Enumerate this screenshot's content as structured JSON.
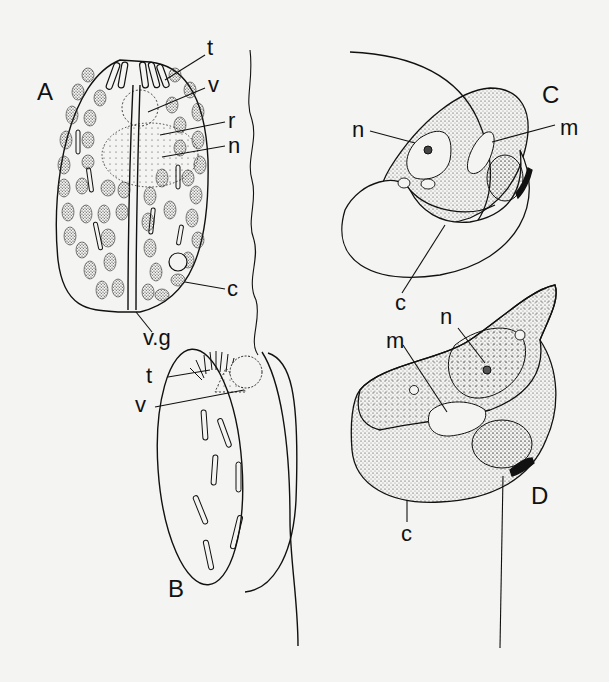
{
  "figure": {
    "background": "#f4f4f2",
    "ink": "#111111",
    "panels": [
      {
        "id": "A",
        "label": "A",
        "parts": [
          "t",
          "v",
          "r",
          "n",
          "c",
          "v.g"
        ]
      },
      {
        "id": "B",
        "label": "B",
        "parts": [
          "t",
          "v"
        ]
      },
      {
        "id": "C",
        "label": "C",
        "parts": [
          "n",
          "m",
          "c"
        ]
      },
      {
        "id": "D",
        "label": "D",
        "parts": [
          "n",
          "m",
          "c"
        ]
      }
    ],
    "labels": {
      "A": {
        "panel": "A",
        "t": "t",
        "v": "v",
        "r": "r",
        "n": "n",
        "c": "c",
        "vg": "v.g"
      },
      "B": {
        "panel": "B",
        "t": "t",
        "v": "v"
      },
      "C": {
        "panel": "C",
        "n": "n",
        "m": "m",
        "c": "c"
      },
      "D": {
        "panel": "D",
        "n": "n",
        "m": "m",
        "c": "c"
      }
    }
  }
}
